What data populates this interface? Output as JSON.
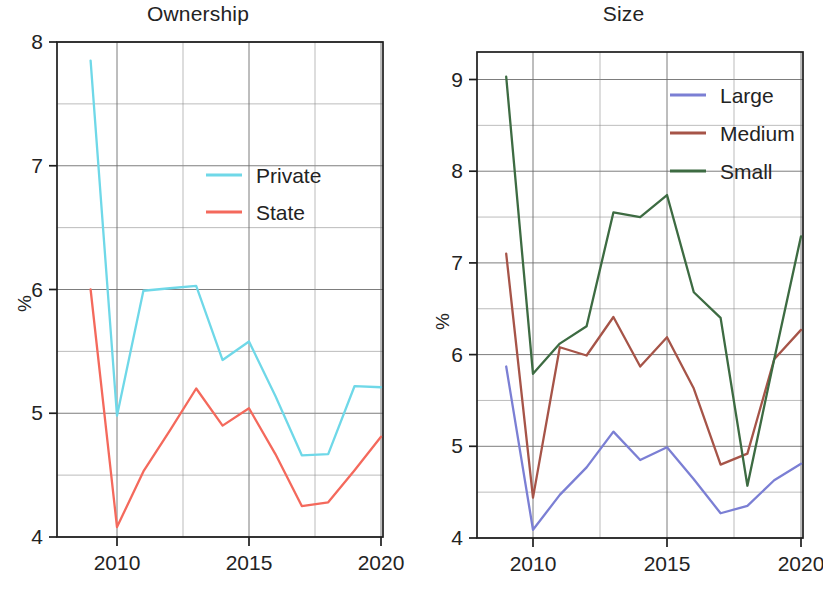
{
  "figure": {
    "width": 823,
    "height": 593,
    "background": "#ffffff"
  },
  "panels": [
    {
      "id": "ownership",
      "title": "Ownership",
      "ylabel": "%",
      "yticks": [
        "4",
        "5",
        "6",
        "7",
        "8"
      ],
      "xticks": [
        "2010",
        "2015",
        "2020"
      ]
    },
    {
      "id": "size",
      "title": "Size",
      "ylabel": "%",
      "yticks": [
        "4",
        "5",
        "6",
        "7",
        "8",
        "9"
      ],
      "xticks": [
        "2010",
        "2015",
        "2020"
      ]
    }
  ],
  "legends": {
    "ownership": [
      {
        "label": "Private",
        "color": "#6FD8E8"
      },
      {
        "label": "State",
        "color": "#F4695C"
      }
    ],
    "size": [
      {
        "label": "Large",
        "color": "#7B7FD4"
      },
      {
        "label": "Medium",
        "color": "#A65448"
      },
      {
        "label": "Small",
        "color": "#3D6B42"
      }
    ]
  },
  "chart_data": [
    {
      "type": "line",
      "title": "Ownership",
      "xlabel": "",
      "ylabel": "%",
      "x": [
        2009,
        2010,
        2011,
        2012,
        2013,
        2014,
        2015,
        2016,
        2017,
        2018,
        2019,
        2020
      ],
      "xlim": [
        2008.6,
        2020.4
      ],
      "ylim": [
        4,
        8
      ],
      "xticks": [
        2010,
        2015,
        2020
      ],
      "yticks": [
        4,
        5,
        6,
        7,
        8
      ],
      "grid": true,
      "legend_position": "upper center",
      "series": [
        {
          "name": "Private",
          "color": "#6FD8E8",
          "values": [
            7.85,
            4.98,
            5.99,
            6.01,
            6.03,
            5.43,
            5.58,
            5.14,
            4.66,
            4.67,
            5.22,
            5.21
          ]
        },
        {
          "name": "State",
          "color": "#F4695C",
          "values": [
            6.0,
            4.08,
            4.53,
            4.86,
            5.2,
            4.9,
            5.04,
            4.67,
            4.25,
            4.28,
            4.54,
            4.81
          ]
        }
      ]
    },
    {
      "type": "line",
      "title": "Size",
      "xlabel": "",
      "ylabel": "%",
      "x": [
        2009,
        2010,
        2011,
        2012,
        2013,
        2014,
        2015,
        2016,
        2017,
        2018,
        2019,
        2020
      ],
      "xlim": [
        2008.6,
        2020.4
      ],
      "ylim": [
        4,
        9.3
      ],
      "xticks": [
        2010,
        2015,
        2020
      ],
      "yticks": [
        4,
        5,
        6,
        7,
        8,
        9
      ],
      "grid": true,
      "legend_position": "upper right",
      "series": [
        {
          "name": "Large",
          "color": "#7B7FD4",
          "values": [
            5.87,
            4.09,
            4.47,
            4.77,
            5.16,
            4.85,
            4.99,
            4.64,
            4.27,
            4.35,
            4.63,
            4.81
          ]
        },
        {
          "name": "Medium",
          "color": "#A65448",
          "values": [
            7.1,
            4.44,
            6.08,
            5.99,
            6.41,
            5.87,
            6.19,
            5.63,
            4.8,
            4.92,
            5.95,
            6.27
          ]
        },
        {
          "name": "Small",
          "color": "#3D6B42",
          "values": [
            9.03,
            5.79,
            6.12,
            6.31,
            7.55,
            7.5,
            7.74,
            6.68,
            6.4,
            4.57,
            5.95,
            7.29
          ]
        }
      ]
    }
  ]
}
